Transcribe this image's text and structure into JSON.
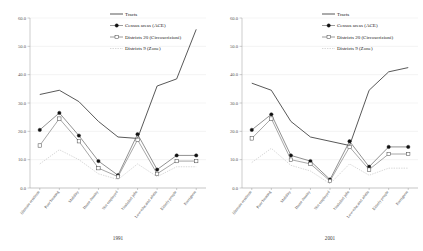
{
  "legend": {
    "position": "top-right",
    "items": [
      {
        "label": "Tracts",
        "marker": "none",
        "style": "solid-dark"
      },
      {
        "label": "Census areas (ACE)",
        "marker": "filled-square",
        "style": "solid-mid"
      },
      {
        "label": "Districts 20 (Circoscrizioni)",
        "marker": "open-square",
        "style": "solid-mid"
      },
      {
        "label": "Districts 9 (Zone)",
        "marker": "none",
        "style": "dotted-light"
      }
    ]
  },
  "chart_data": [
    {
      "type": "line",
      "title": "1991",
      "xlabel": "",
      "ylabel": "",
      "ylim": [
        0,
        60
      ],
      "yticks": [
        "0.0",
        "10.0",
        "20.0",
        "30.0",
        "40.0",
        "50.0",
        "60.0"
      ],
      "grid": true,
      "categories": [
        "Illiterate residents",
        "Poor housing",
        "Mobility",
        "Home density",
        "Not employed",
        "Unskilled jobs",
        "Low-educated adults",
        "Elderly people",
        "Foreigners"
      ],
      "series": [
        {
          "name": "Tracts",
          "values": [
            33.0,
            34.5,
            30.5,
            23.5,
            18.0,
            17.5,
            36.0,
            38.5,
            56.0
          ]
        },
        {
          "name": "Census areas (ACE)",
          "values": [
            20.5,
            26.5,
            18.5,
            9.5,
            4.5,
            19.0,
            6.5,
            11.5,
            11.5
          ]
        },
        {
          "name": "Districts 20 (Circoscrizioni)",
          "values": [
            15.0,
            24.5,
            16.5,
            7.0,
            4.0,
            17.0,
            5.0,
            9.5,
            9.5
          ]
        },
        {
          "name": "Districts 9 (Zone)",
          "values": [
            8.5,
            13.5,
            10.0,
            5.0,
            3.0,
            8.5,
            4.0,
            7.5,
            7.5
          ]
        }
      ]
    },
    {
      "type": "line",
      "title": "2001",
      "xlabel": "",
      "ylabel": "",
      "ylim": [
        0,
        60
      ],
      "yticks": [
        "0.0",
        "10.0",
        "20.0",
        "30.0",
        "40.0",
        "50.0",
        "60.0"
      ],
      "grid": true,
      "categories": [
        "Illiterate residents",
        "Poor housing",
        "Mobility",
        "Home density",
        "Not employed",
        "Unskilled jobs",
        "Low-educated adults",
        "Elderly people",
        "Foreigners"
      ],
      "series": [
        {
          "name": "Tracts",
          "values": [
            37.0,
            34.5,
            23.5,
            18.0,
            16.5,
            15.0,
            34.5,
            41.0,
            42.5
          ]
        },
        {
          "name": "Census areas (ACE)",
          "values": [
            20.5,
            26.0,
            11.5,
            9.5,
            3.0,
            16.5,
            7.5,
            14.5,
            14.5
          ]
        },
        {
          "name": "Districts 20 (Circoscrizioni)",
          "values": [
            17.5,
            24.5,
            10.0,
            8.5,
            2.5,
            14.5,
            6.5,
            12.0,
            12.0
          ]
        },
        {
          "name": "Districts 9 (Zone)",
          "values": [
            9.0,
            14.0,
            8.0,
            6.0,
            1.5,
            8.5,
            4.5,
            7.0,
            7.0
          ]
        }
      ]
    }
  ]
}
